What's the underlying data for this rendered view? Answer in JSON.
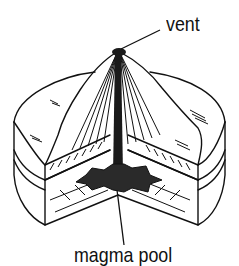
{
  "diagram": {
    "labels": {
      "vent": "vent",
      "magma_pool": "magma pool"
    },
    "colors": {
      "ink": "#111111",
      "background": "#ffffff",
      "magma": "#2a2a2a"
    }
  }
}
